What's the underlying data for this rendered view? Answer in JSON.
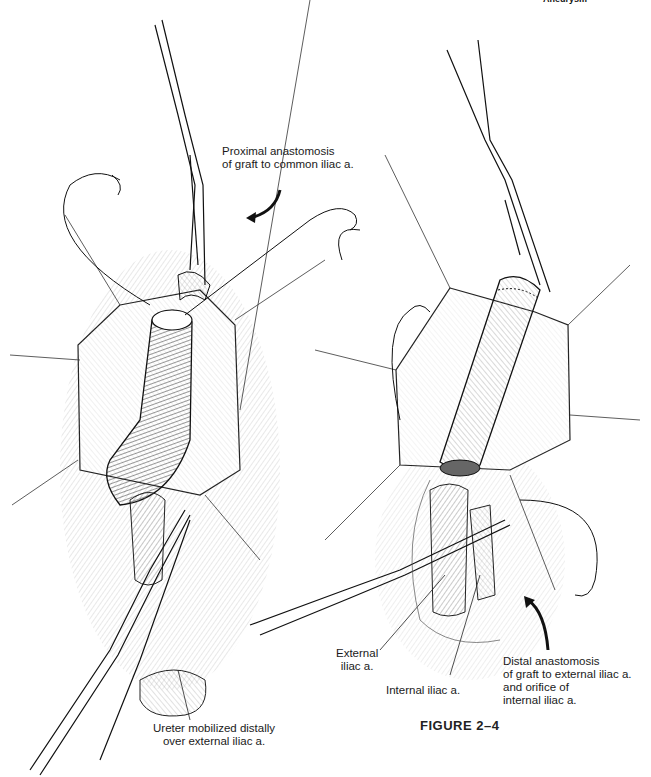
{
  "header": {
    "running_title": "Aneurysm"
  },
  "figure": {
    "caption": "FIGURE 2–4"
  },
  "left_panel": {
    "name": "Proximal anastomosis stage",
    "labels": {
      "proximal_line1": "Proximal anastomosis",
      "proximal_line2": "of graft to common iliac a.",
      "ureter_line1": "Ureter mobilized distally",
      "ureter_line2": "over external iliac a."
    }
  },
  "right_panel": {
    "name": "Distal anastomosis stage",
    "labels": {
      "external_line1": "External",
      "external_line2": "iliac a.",
      "internal": "Internal iliac a.",
      "distal_line1": "Distal anastomosis",
      "distal_line2": "of graft to external iliac a.",
      "distal_line3": "and orifice of",
      "distal_line4": "internal iliac a."
    }
  },
  "colors": {
    "ink": "#1a1a1a",
    "background": "#ffffff",
    "hatch": "#777777"
  }
}
